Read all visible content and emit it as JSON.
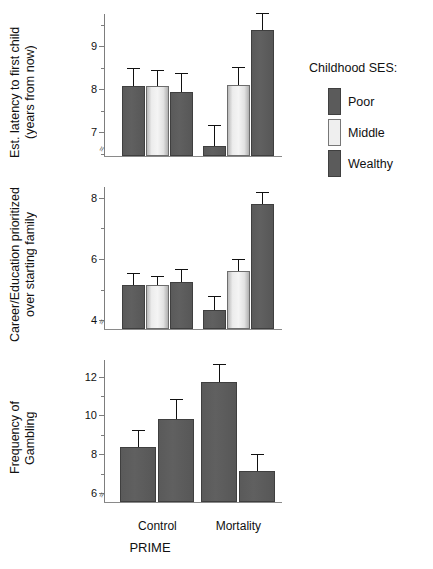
{
  "figure": {
    "xlabel": "PRIME",
    "categories": [
      "Control",
      "Mortality"
    ]
  },
  "legend": {
    "title": "Childhood SES:",
    "entries": [
      {
        "label": "Poor",
        "swatch": "dark"
      },
      {
        "label": "Middle",
        "swatch": "light"
      },
      {
        "label": "Wealthy",
        "swatch": "dark"
      }
    ]
  },
  "chart_data": [
    {
      "type": "bar",
      "title": "",
      "ylabel": "Est. latency to first child\n(years from now)",
      "xlabel": "PRIME",
      "categories": [
        "Control",
        "Mortality"
      ],
      "ylim": [
        6.45,
        9.75
      ],
      "yticks": [
        7,
        8,
        9
      ],
      "yticklabels": [
        "7",
        "8",
        "9"
      ],
      "yminorticks": [
        6.5,
        7.5,
        8.5,
        9.5
      ],
      "grid": false,
      "axis_break": true,
      "series": [
        {
          "name": "Poor",
          "values": [
            8.07,
            6.68
          ],
          "errors": [
            0.42,
            0.5
          ]
        },
        {
          "name": "Middle",
          "values": [
            8.07,
            8.11
          ],
          "errors": [
            0.39,
            0.41
          ]
        },
        {
          "name": "Wealthy",
          "values": [
            7.94,
            9.38
          ],
          "errors": [
            0.43,
            0.4
          ]
        }
      ]
    },
    {
      "type": "bar",
      "title": "",
      "ylabel": "Career/Education prioritized\nover starting family",
      "xlabel": "PRIME",
      "categories": [
        "Control",
        "Mortality"
      ],
      "ylim": [
        3.72,
        8.35
      ],
      "yticks": [
        4,
        6,
        8
      ],
      "yticklabels": [
        "4",
        "6",
        "8"
      ],
      "yminorticks": [
        5,
        7
      ],
      "grid": false,
      "axis_break": true,
      "series": [
        {
          "name": "Poor",
          "values": [
            5.17,
            4.35
          ],
          "errors": [
            0.39,
            0.46
          ]
        },
        {
          "name": "Middle",
          "values": [
            5.17,
            5.6
          ],
          "errors": [
            0.28,
            0.4
          ]
        },
        {
          "name": "Wealthy",
          "values": [
            5.25,
            7.78
          ],
          "errors": [
            0.42,
            0.4
          ]
        }
      ]
    },
    {
      "type": "bar",
      "title": "",
      "ylabel": "Frequency of\nGambling",
      "xlabel": "PRIME",
      "categories": [
        "Control",
        "Mortality"
      ],
      "ylim": [
        5.55,
        12.85
      ],
      "yticks": [
        6,
        8,
        10,
        12
      ],
      "yticklabels": [
        "6",
        "8",
        "10",
        "12"
      ],
      "yminorticks": [
        7,
        9,
        11
      ],
      "grid": false,
      "axis_break": true,
      "series": [
        {
          "name": "Poor",
          "values": [
            8.38,
            11.72
          ],
          "errors": [
            0.85,
            0.95
          ]
        },
        {
          "name": "Wealthy",
          "values": [
            9.82,
            7.12
          ],
          "errors": [
            1.0,
            0.9
          ]
        }
      ]
    }
  ],
  "colors": {
    "dark": "#5b5b5b",
    "light": "#efefef",
    "axis": "#7d7d7d",
    "error": "#111111"
  }
}
